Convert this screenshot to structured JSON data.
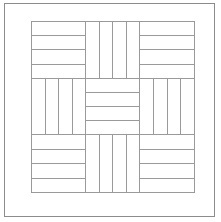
{
  "figure": {
    "background_color": "#ffffff",
    "line_color": "#9a9a9a",
    "outer_frame_color": "#8c8c8c",
    "line_width_px": 1,
    "canvas": {
      "width": 221,
      "height": 222
    }
  },
  "outer_frame": {
    "name": "outer-frame",
    "left": 4,
    "top": 3,
    "width": 211,
    "height": 214
  },
  "pattern_grid": {
    "name": "pattern-grid",
    "left": 31,
    "top": 21,
    "width": 164,
    "height": 172,
    "rows": 3,
    "columns": 3,
    "strips_per_block": 4,
    "blocks": [
      {
        "row": 0,
        "col": 0,
        "position": "top-left",
        "orientation": "horizontal",
        "strips": 4
      },
      {
        "row": 0,
        "col": 1,
        "position": "top-center",
        "orientation": "vertical",
        "strips": 4
      },
      {
        "row": 0,
        "col": 2,
        "position": "top-right",
        "orientation": "horizontal",
        "strips": 4
      },
      {
        "row": 1,
        "col": 0,
        "position": "middle-left",
        "orientation": "vertical",
        "strips": 4
      },
      {
        "row": 1,
        "col": 1,
        "position": "middle-center",
        "orientation": "horizontal",
        "strips": 4
      },
      {
        "row": 1,
        "col": 2,
        "position": "middle-right",
        "orientation": "vertical",
        "strips": 4
      },
      {
        "row": 2,
        "col": 0,
        "position": "bottom-left",
        "orientation": "horizontal",
        "strips": 4
      },
      {
        "row": 2,
        "col": 1,
        "position": "bottom-center",
        "orientation": "vertical",
        "strips": 4
      },
      {
        "row": 2,
        "col": 2,
        "position": "bottom-right",
        "orientation": "horizontal",
        "strips": 4
      }
    ]
  }
}
